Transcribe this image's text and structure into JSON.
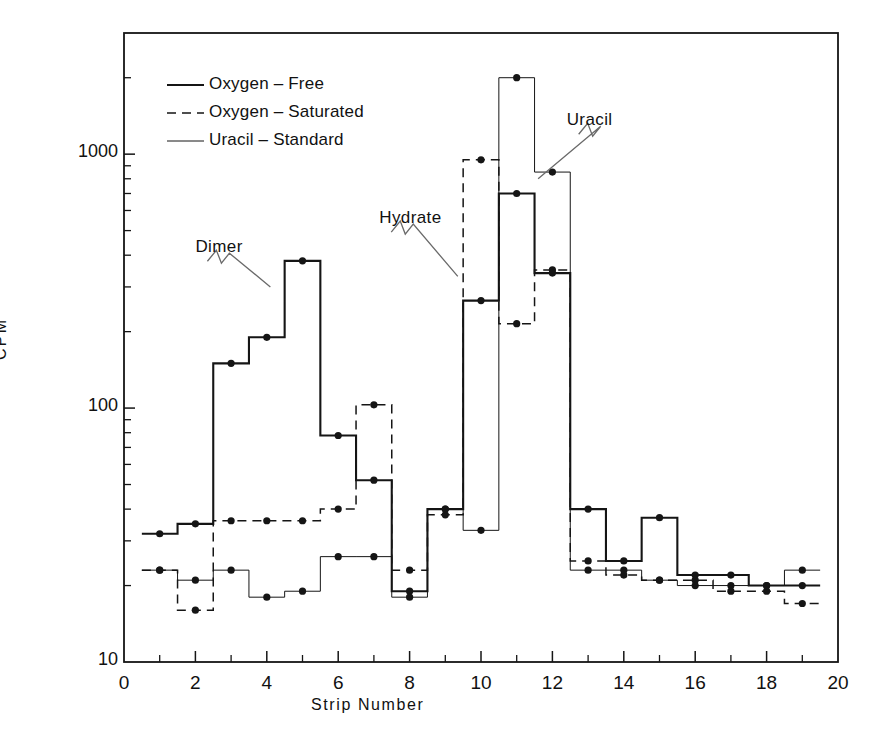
{
  "chart_data": {
    "type": "line",
    "title": "",
    "xlabel": "Strip  Number",
    "ylabel": "CPM",
    "xlim": [
      0,
      20
    ],
    "ylim": [
      10,
      3000
    ],
    "yscale": "log",
    "grid": false,
    "legend_position": "top-left",
    "x_ticks_major": [
      0,
      2,
      4,
      6,
      8,
      10,
      12,
      14,
      16,
      18,
      20
    ],
    "x_ticks_minor": [
      1,
      3,
      5,
      7,
      9,
      11,
      13,
      15,
      17,
      19
    ],
    "y_ticks_major": [
      10,
      100,
      1000
    ],
    "y_tick_labels": [
      "10",
      "100",
      "1000"
    ],
    "y_ticks_minor": [
      20,
      30,
      40,
      50,
      60,
      70,
      80,
      90,
      200,
      300,
      400,
      500,
      600,
      700,
      800,
      900,
      2000,
      3000
    ],
    "marker": "filled-circle",
    "step_style": "mid",
    "strips": [
      1,
      2,
      3,
      4,
      5,
      6,
      7,
      8,
      9,
      10,
      11,
      12,
      13,
      14,
      15,
      16,
      17,
      18,
      19
    ],
    "series": [
      {
        "name": "Oxygen-Free",
        "style": "solid",
        "linewidth": 2.1,
        "values": [
          32,
          35,
          150,
          190,
          380,
          78,
          52,
          19,
          40,
          265,
          700,
          340,
          40,
          25,
          37,
          22,
          22,
          20,
          20
        ]
      },
      {
        "name": "Oxygen-Saturated",
        "style": "dashed",
        "linewidth": 1.5,
        "values": [
          23,
          16,
          36,
          36,
          36,
          40,
          103,
          23,
          38,
          950,
          215,
          350,
          25,
          22,
          21,
          21,
          19,
          19,
          17
        ]
      },
      {
        "name": "Uracil-Standard",
        "style": "thin",
        "linewidth": 1.0,
        "values": [
          23,
          21,
          23,
          18,
          19,
          26,
          26,
          18,
          40,
          33,
          2000,
          850,
          23,
          23,
          21,
          20,
          20,
          20,
          23
        ]
      }
    ],
    "annotations": [
      {
        "text": "Dimer",
        "x": 2.0,
        "y": 430,
        "leader_to_x": 4.1,
        "leader_to_y": 300
      },
      {
        "text": "Hydrate",
        "x": 7.15,
        "y": 560,
        "leader_to_x": 9.35,
        "leader_to_y": 330
      },
      {
        "text": "Uracil",
        "x": 12.4,
        "y": 1360,
        "leader_to_x": 11.6,
        "leader_to_y": 800
      }
    ]
  },
  "legend": {
    "entries": [
      {
        "label": "Oxygen – Free",
        "style": "solid"
      },
      {
        "label": "Oxygen – Saturated",
        "style": "dashed"
      },
      {
        "label": "Uracil – Standard",
        "style": "thin"
      }
    ]
  },
  "axes": {
    "x_title": "Strip  Number",
    "y_title": "CPM",
    "x_tick_labels": [
      "0",
      "2",
      "4",
      "6",
      "8",
      "10",
      "12",
      "14",
      "16",
      "18",
      "20"
    ],
    "y_tick_labels": [
      "1000",
      "100",
      "10"
    ]
  },
  "style": {
    "ink": "#151515",
    "background": "#ffffff"
  }
}
